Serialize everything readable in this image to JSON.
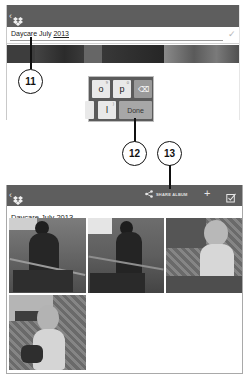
{
  "top_screen": {
    "app_bar": {
      "back_icon": "chevron-left",
      "logo_icon": "dropbox-logo"
    },
    "edit_field": {
      "value_prefix": "Daycare July ",
      "value_underlined": "2013",
      "confirm_icon": "checkmark"
    },
    "keyboard": {
      "keys_row1": [
        {
          "label": "o",
          "hint": "9"
        },
        {
          "label": "p",
          "hint": "0"
        },
        {
          "label": "⌫",
          "name": "backspace"
        }
      ],
      "keys_row2": [
        {
          "label": "l",
          "hint": ")"
        },
        {
          "label": "Done",
          "name": "done"
        }
      ]
    }
  },
  "callouts": [
    {
      "number": "11"
    },
    {
      "number": "12"
    },
    {
      "number": "13"
    }
  ],
  "bottom_screen": {
    "app_bar": {
      "back_icon": "chevron-left",
      "logo_icon": "dropbox-logo",
      "share_label": "SHARE ALBUM",
      "add_icon": "+",
      "select_icon": "checkbox"
    },
    "album_title": "Daycare July 2013",
    "photos": [
      {
        "name": "photo-child-chair-1"
      },
      {
        "name": "photo-child-chair-2"
      },
      {
        "name": "photo-baby-wicker-1"
      },
      {
        "name": "photo-baby-wicker-2"
      }
    ]
  },
  "colors": {
    "app_bar": "#5e5e5e",
    "callout_stroke": "#111111",
    "frame_border": "#a9a9a9"
  }
}
